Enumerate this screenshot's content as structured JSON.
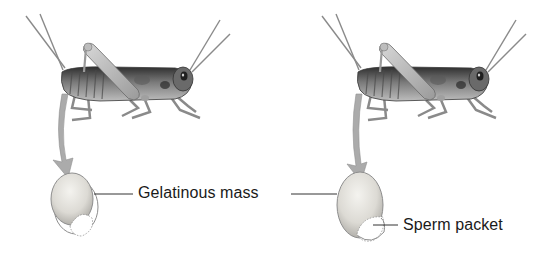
{
  "figure": {
    "panels": [
      {
        "id": "left",
        "subject": "cricket",
        "element": "gelatinous mass with sperm packet"
      },
      {
        "id": "right",
        "subject": "cricket",
        "element": "gelatinous mass with sperm packet"
      }
    ],
    "labels": {
      "gelatinous_mass": "Gelatinous mass",
      "sperm_packet": "Sperm packet"
    },
    "colors": {
      "insect_dark": "#3a3a3a",
      "insect_mid": "#8a8a8a",
      "insect_light": "#c9c9c9",
      "arrow": "#a9a9a9",
      "egg_fill": "#e4e2dc",
      "egg_stroke": "#8e8e8e",
      "leader_line": "#333333",
      "text": "#1a1a1a"
    }
  }
}
